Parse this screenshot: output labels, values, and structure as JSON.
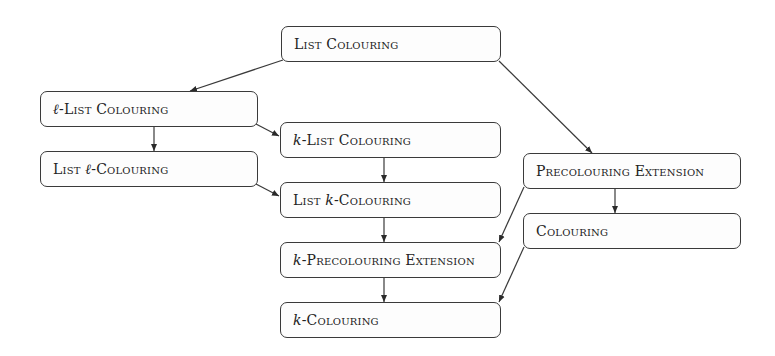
{
  "diagram": {
    "type": "hierarchy",
    "nodes": [
      {
        "id": "list_colouring",
        "prefix": "",
        "label": "List Colouring",
        "suffix": "",
        "x": 281,
        "y": 26,
        "w": 220,
        "h": 36
      },
      {
        "id": "l_list_colouring",
        "prefix": "ℓ",
        "label": "-List Colouring",
        "suffix": "",
        "x": 40,
        "y": 91,
        "w": 218,
        "h": 36
      },
      {
        "id": "list_l_colouring",
        "prefix": "List ",
        "italic": "ℓ",
        "label": "-Colouring",
        "x": 40,
        "y": 151,
        "w": 218,
        "h": 36
      },
      {
        "id": "k_list_colouring",
        "prefix": "k",
        "label": "-List Colouring",
        "suffix": "",
        "x": 280,
        "y": 122,
        "w": 221,
        "h": 36
      },
      {
        "id": "list_k_colouring",
        "prefix": "List ",
        "italic": "k",
        "label": "-Colouring",
        "x": 280,
        "y": 182,
        "w": 221,
        "h": 36
      },
      {
        "id": "k_precolouring_extension",
        "prefix": "k",
        "label": "-Precolouring Extension",
        "suffix": "",
        "x": 280,
        "y": 242,
        "w": 221,
        "h": 36
      },
      {
        "id": "k_colouring",
        "prefix": "k",
        "label": "-Colouring",
        "suffix": "",
        "x": 280,
        "y": 302,
        "w": 221,
        "h": 36
      },
      {
        "id": "precolouring_extension",
        "prefix": "",
        "label": "Precolouring Extension",
        "suffix": "",
        "x": 523,
        "y": 153,
        "w": 218,
        "h": 36
      },
      {
        "id": "colouring",
        "prefix": "",
        "label": "Colouring",
        "suffix": "",
        "x": 523,
        "y": 213,
        "w": 218,
        "h": 36
      }
    ],
    "edges": [
      {
        "from": "list_colouring",
        "to": "l_list_colouring"
      },
      {
        "from": "list_colouring",
        "to": "precolouring_extension"
      },
      {
        "from": "l_list_colouring",
        "to": "list_l_colouring"
      },
      {
        "from": "l_list_colouring",
        "to": "k_list_colouring"
      },
      {
        "from": "list_l_colouring",
        "to": "list_k_colouring"
      },
      {
        "from": "k_list_colouring",
        "to": "list_k_colouring"
      },
      {
        "from": "list_k_colouring",
        "to": "k_precolouring_extension"
      },
      {
        "from": "precolouring_extension",
        "to": "k_precolouring_extension"
      },
      {
        "from": "precolouring_extension",
        "to": "colouring"
      },
      {
        "from": "k_precolouring_extension",
        "to": "k_colouring"
      },
      {
        "from": "colouring",
        "to": "k_colouring"
      }
    ]
  },
  "labels": {
    "list_colouring": "List Colouring",
    "l_list_colouring_var": "ℓ",
    "l_list_colouring": "-List Colouring",
    "list_l_colouring_pre": "List ",
    "list_l_colouring_var": "ℓ",
    "list_l_colouring_post": "-Colouring",
    "k_list_colouring_var": "k",
    "k_list_colouring": "-List Colouring",
    "list_k_colouring_pre": "List ",
    "list_k_colouring_var": "k",
    "list_k_colouring_post": "-Colouring",
    "k_precolouring_extension_var": "k",
    "k_precolouring_extension": "-Precolouring Extension",
    "k_colouring_var": "k",
    "k_colouring": "-Colouring",
    "precolouring_extension": "Precolouring Extension",
    "colouring": "Colouring"
  },
  "colors": {
    "stroke": "#3a3a3a",
    "text": "#222222",
    "background": "#ffffff"
  }
}
